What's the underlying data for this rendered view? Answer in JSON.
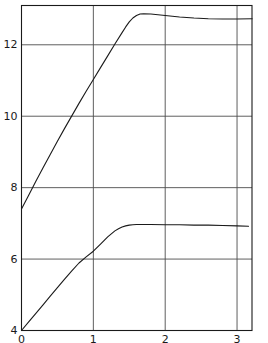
{
  "chart_data": {
    "type": "line",
    "title": "",
    "subtitle": "",
    "xlabel": "",
    "ylabel": "",
    "xlim": [
      0,
      3.2083
    ],
    "ylim": [
      4,
      13.1
    ],
    "grid": true,
    "grid_axes": "both",
    "legend": "none",
    "xticks": [
      0,
      1,
      2,
      3
    ],
    "xtick_labels": [
      "0",
      "1",
      "2",
      "3"
    ],
    "yticks": [
      6,
      8,
      10,
      12
    ],
    "ytick_labels": [
      "6",
      "8",
      "10",
      "12"
    ],
    "line_color": "#1a1a1a",
    "grid_color": "#4d4d4d",
    "axis_color": "#1a1a1a",
    "background": "#ffffff",
    "series": [
      {
        "name": "upper-curve",
        "x": [
          0.0,
          0.1,
          0.2,
          0.3,
          0.4,
          0.5,
          0.6,
          0.7,
          0.8,
          0.9,
          1.0,
          1.1,
          1.2,
          1.3,
          1.4,
          1.45,
          1.5,
          1.55,
          1.6,
          1.65,
          1.7,
          1.8,
          1.9,
          2.0,
          2.2,
          2.4,
          2.6,
          2.8,
          3.0,
          3.21
        ],
        "y": [
          7.4,
          7.79,
          8.18,
          8.56,
          8.93,
          9.3,
          9.66,
          10.01,
          10.36,
          10.7,
          11.03,
          11.36,
          11.69,
          12.02,
          12.34,
          12.5,
          12.64,
          12.75,
          12.82,
          12.86,
          12.87,
          12.86,
          12.84,
          12.82,
          12.78,
          12.75,
          12.73,
          12.72,
          12.72,
          12.73
        ]
      },
      {
        "name": "lower-curve",
        "x": [
          0.0,
          0.1,
          0.2,
          0.3,
          0.4,
          0.5,
          0.6,
          0.7,
          0.8,
          0.9,
          1.0,
          1.1,
          1.2,
          1.3,
          1.35,
          1.4,
          1.45,
          1.5,
          1.55,
          1.6,
          1.7,
          1.8,
          2.0,
          2.2,
          2.4,
          2.6,
          2.8,
          3.0,
          3.16
        ],
        "y": [
          4.0,
          4.24,
          4.48,
          4.72,
          4.96,
          5.2,
          5.44,
          5.67,
          5.89,
          6.06,
          6.22,
          6.42,
          6.62,
          6.79,
          6.85,
          6.9,
          6.93,
          6.95,
          6.96,
          6.97,
          6.97,
          6.97,
          6.96,
          6.96,
          6.95,
          6.95,
          6.94,
          6.93,
          6.92
        ]
      }
    ]
  },
  "axes": {
    "bottom_origin_label": "0",
    "left_origin_label": "4"
  }
}
